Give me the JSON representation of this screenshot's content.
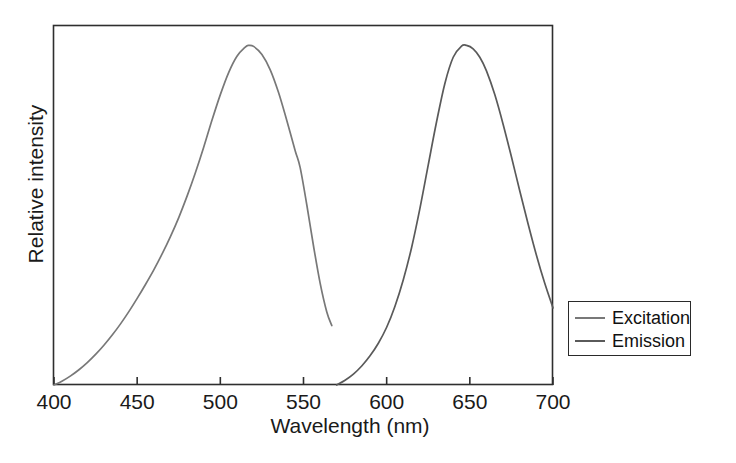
{
  "chart_data": {
    "type": "line",
    "title": "",
    "xlabel": "Wavelength (nm)",
    "ylabel": "Relative intensity",
    "xlim": [
      400,
      700
    ],
    "ylim": [
      0,
      1.06
    ],
    "grid": false,
    "legend_position": "right",
    "xticks": [
      "400",
      "450",
      "500",
      "550",
      "600",
      "650",
      "700"
    ],
    "xtick_values": [
      400,
      450,
      500,
      550,
      600,
      650,
      700
    ],
    "yticks": [],
    "series": [
      {
        "name": "Excitation",
        "color": "#787878",
        "x": [
          400,
          405,
          410,
          415,
          420,
          425,
          430,
          435,
          440,
          445,
          450,
          455,
          460,
          465,
          470,
          475,
          480,
          485,
          490,
          495,
          500,
          505,
          510,
          515,
          517,
          520,
          525,
          530,
          535,
          540,
          545,
          548,
          552,
          556,
          560,
          564,
          567
        ],
        "values": [
          0.0,
          0.012,
          0.027,
          0.045,
          0.066,
          0.09,
          0.117,
          0.147,
          0.18,
          0.216,
          0.255,
          0.296,
          0.339,
          0.386,
          0.437,
          0.493,
          0.556,
          0.625,
          0.7,
          0.78,
          0.855,
          0.92,
          0.968,
          0.995,
          1.0,
          0.997,
          0.973,
          0.928,
          0.861,
          0.778,
          0.69,
          0.64,
          0.53,
          0.41,
          0.3,
          0.215,
          0.175
        ]
      },
      {
        "name": "Emission",
        "color": "#5a5a5a",
        "x": [
          570,
          575,
          580,
          585,
          590,
          595,
          600,
          605,
          610,
          615,
          620,
          625,
          630,
          635,
          640,
          645,
          648,
          652,
          656,
          660,
          665,
          670,
          675,
          680,
          685,
          690,
          695,
          700
        ],
        "values": [
          0.0,
          0.014,
          0.032,
          0.056,
          0.086,
          0.123,
          0.17,
          0.232,
          0.31,
          0.405,
          0.52,
          0.648,
          0.775,
          0.888,
          0.965,
          0.998,
          1.0,
          0.99,
          0.965,
          0.925,
          0.855,
          0.768,
          0.672,
          0.572,
          0.475,
          0.383,
          0.3,
          0.227
        ]
      }
    ]
  },
  "legend": {
    "items": [
      {
        "label": "Excitation"
      },
      {
        "label": "Emission"
      }
    ]
  },
  "axes": {
    "x_title": "Wavelength (nm)",
    "y_title": "Relative intensity",
    "x_tick_labels": [
      "400",
      "450",
      "500",
      "550",
      "600",
      "650",
      "700"
    ]
  },
  "colors": {
    "excitation": "#787878",
    "emission": "#5a5a5a",
    "frame": "#2e2e2e",
    "text": "#1a1a1a"
  }
}
